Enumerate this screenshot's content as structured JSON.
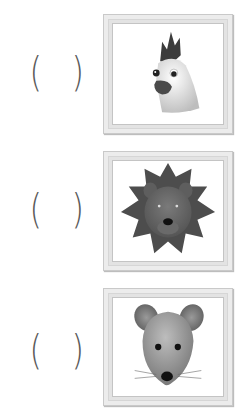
{
  "worksheet": {
    "items": [
      {
        "paren_open": "(",
        "paren_close": ")",
        "answer": "",
        "picture": {
          "animal": "rooster",
          "icon": "rooster-head-icon"
        }
      },
      {
        "paren_open": "(",
        "paren_close": ")",
        "answer": "",
        "picture": {
          "animal": "lion",
          "icon": "lion-head-icon"
        }
      },
      {
        "paren_open": "(",
        "paren_close": ")",
        "answer": "",
        "picture": {
          "animal": "mouse",
          "icon": "mouse-head-icon"
        }
      }
    ]
  },
  "colors": {
    "paren": "#5a5a5a",
    "frame": "#ececec",
    "frame_border": "#c9c9c9",
    "mat": "#ffffff"
  }
}
